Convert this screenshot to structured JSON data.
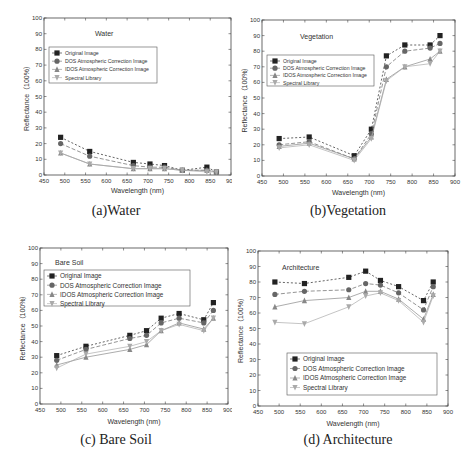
{
  "wavelengths": [
    490,
    560,
    665,
    705,
    740,
    783,
    842,
    865
  ],
  "series_names": [
    "Original Image",
    "DOS Atmospheric Correction Image",
    "IDOS Atmospheric Correction Image",
    "Spectral Library"
  ],
  "chart_data": [
    {
      "type": "line",
      "id": "a",
      "title": "Water",
      "caption": "(a)Water",
      "xlabel": "Wavelength (nm)",
      "ylabel": "Reflectance（100%）",
      "xlim": [
        450,
        900
      ],
      "ylim": [
        0,
        100
      ],
      "xticks": [
        450,
        500,
        550,
        600,
        650,
        700,
        750,
        800,
        850,
        900
      ],
      "yticks": [
        0,
        10,
        20,
        30,
        40,
        50,
        60,
        70,
        80,
        90,
        100
      ],
      "grid": false,
      "legend_position": "upper-left",
      "x": [
        490,
        560,
        665,
        705,
        740,
        783,
        842,
        865
      ],
      "series": [
        {
          "name": "Original Image",
          "marker": "square",
          "values": [
            24,
            15,
            8,
            7,
            6,
            3,
            5,
            2
          ]
        },
        {
          "name": "DOS Atmospheric Correction Image",
          "marker": "circle",
          "values": [
            20,
            12,
            6,
            5,
            5,
            3,
            3,
            2
          ]
        },
        {
          "name": "IDOS Atmospheric Correction Image",
          "marker": "triangle-up",
          "values": [
            14,
            7,
            4,
            4,
            4,
            3,
            3,
            2
          ]
        },
        {
          "name": "Spectral Library",
          "marker": "triangle-down",
          "values": [
            14,
            7,
            4,
            4,
            4,
            3,
            2,
            2
          ]
        }
      ]
    },
    {
      "type": "line",
      "id": "b",
      "title": "Vegetation",
      "caption": "(b)Vegetation",
      "xlabel": "Wavelength (nm)",
      "ylabel": "Reflectance（100%）",
      "xlim": [
        450,
        900
      ],
      "ylim": [
        0,
        100
      ],
      "xticks": [
        450,
        500,
        550,
        600,
        650,
        700,
        750,
        800,
        850,
        900
      ],
      "yticks": [
        0,
        10,
        20,
        30,
        40,
        50,
        60,
        70,
        80,
        90,
        100
      ],
      "grid": false,
      "legend_position": "upper-left",
      "x": [
        490,
        560,
        665,
        705,
        740,
        783,
        842,
        865
      ],
      "series": [
        {
          "name": "Original Image",
          "marker": "square",
          "values": [
            24,
            25,
            13,
            30,
            77,
            84,
            84,
            90
          ]
        },
        {
          "name": "DOS Atmospheric Correction Image",
          "marker": "circle",
          "values": [
            20,
            22,
            11,
            27,
            70,
            80,
            82,
            85
          ]
        },
        {
          "name": "IDOS Atmospheric Correction Image",
          "marker": "triangle-up",
          "values": [
            19,
            21,
            11,
            25,
            62,
            70,
            75,
            80
          ]
        },
        {
          "name": "Spectral Library",
          "marker": "triangle-down",
          "values": [
            18,
            20,
            10,
            24,
            61,
            70,
            72,
            80
          ]
        }
      ]
    },
    {
      "type": "line",
      "id": "c",
      "title": "Bare Soil",
      "caption": "(c) Bare Soil",
      "xlabel": "Wavelength (nm)",
      "ylabel": "Reflectance（100%）",
      "xlim": [
        450,
        900
      ],
      "ylim": [
        0,
        100
      ],
      "xticks": [
        450,
        500,
        550,
        600,
        650,
        700,
        750,
        800,
        850,
        900
      ],
      "yticks": [
        0,
        10,
        20,
        30,
        40,
        50,
        60,
        70,
        80,
        90,
        100
      ],
      "grid": false,
      "legend_position": "upper-left",
      "x": [
        490,
        560,
        665,
        705,
        740,
        783,
        842,
        865
      ],
      "series": [
        {
          "name": "Original Image",
          "marker": "square",
          "values": [
            31,
            37,
            44,
            47,
            55,
            58,
            54,
            65
          ]
        },
        {
          "name": "DOS Atmospheric Correction Image",
          "marker": "circle",
          "values": [
            28,
            35,
            42,
            44,
            52,
            55,
            52,
            60
          ]
        },
        {
          "name": "IDOS Atmospheric Correction Image",
          "marker": "triangle-up",
          "values": [
            25,
            30,
            35,
            38,
            47,
            52,
            48,
            55
          ]
        },
        {
          "name": "Spectral Library",
          "marker": "triangle-down",
          "values": [
            23,
            32,
            37,
            40,
            47,
            51,
            47,
            55
          ]
        }
      ]
    },
    {
      "type": "line",
      "id": "d",
      "title": "Architecture",
      "caption": "(d) Architecture",
      "xlabel": "Wavelength (nm)",
      "ylabel": "Reflectance（100%）",
      "xlim": [
        450,
        900
      ],
      "ylim": [
        0,
        100
      ],
      "xticks": [
        450,
        500,
        550,
        600,
        650,
        700,
        750,
        800,
        850,
        900
      ],
      "yticks": [
        0,
        10,
        20,
        30,
        40,
        50,
        60,
        70,
        80,
        90,
        100
      ],
      "grid": false,
      "legend_position": "lower-center",
      "x": [
        490,
        560,
        665,
        705,
        740,
        783,
        842,
        865
      ],
      "series": [
        {
          "name": "Original Image",
          "marker": "square",
          "values": [
            80,
            79,
            83,
            87,
            81,
            77,
            68,
            80
          ]
        },
        {
          "name": "DOS Atmospheric Correction Image",
          "marker": "circle",
          "values": [
            72,
            74,
            75,
            79,
            78,
            73,
            62,
            77
          ]
        },
        {
          "name": "IDOS Atmospheric Correction Image",
          "marker": "triangle-up",
          "values": [
            64,
            68,
            70,
            74,
            74,
            69,
            56,
            72
          ]
        },
        {
          "name": "Spectral Library",
          "marker": "triangle-down",
          "values": [
            54,
            53,
            64,
            71,
            73,
            68,
            54,
            71
          ]
        }
      ]
    }
  ]
}
